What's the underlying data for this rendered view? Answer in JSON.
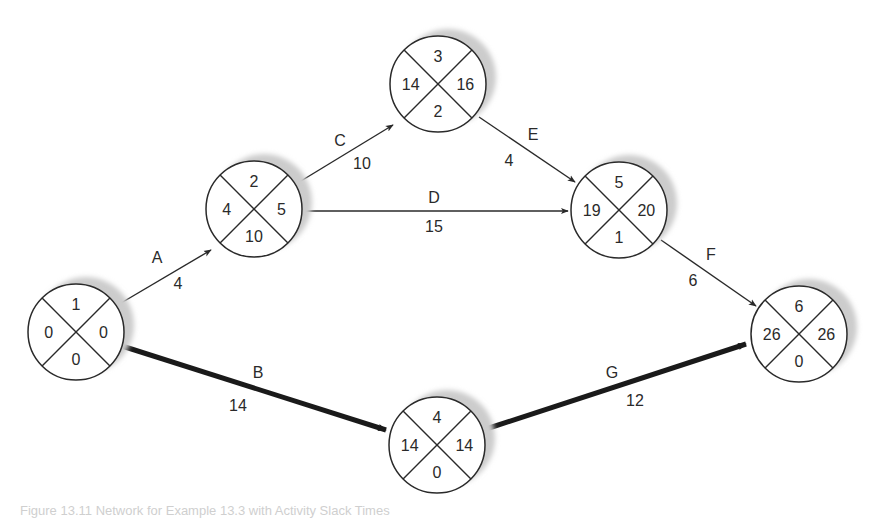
{
  "diagram": {
    "type": "activity-on-arrow network (critical path)",
    "node_radius": 48,
    "node_quadrants": [
      "top",
      "left",
      "right",
      "bottom"
    ],
    "colors": {
      "line": "#2a2a2a",
      "shadow": "#cccccc",
      "critical": "#1a1a1a"
    },
    "nodes": [
      {
        "id": "1",
        "cx": 76,
        "cy": 332,
        "top": "1",
        "left": "0",
        "right": "0",
        "bottom": "0"
      },
      {
        "id": "2",
        "cx": 254,
        "cy": 209,
        "top": "2",
        "left": "4",
        "right": "5",
        "bottom": "10"
      },
      {
        "id": "3",
        "cx": 438,
        "cy": 84,
        "top": "3",
        "left": "14",
        "right": "16",
        "bottom": "2"
      },
      {
        "id": "5",
        "cx": 619,
        "cy": 210,
        "top": "5",
        "left": "19",
        "right": "20",
        "bottom": "1"
      },
      {
        "id": "6",
        "cx": 799,
        "cy": 334,
        "top": "6",
        "left": "26",
        "right": "26",
        "bottom": "0"
      },
      {
        "id": "4",
        "cx": 437,
        "cy": 445,
        "top": "4",
        "left": "14",
        "right": "14",
        "bottom": "0"
      }
    ],
    "edges": [
      {
        "activity": "A",
        "duration": "4",
        "from": "1",
        "to": "2",
        "critical": false,
        "x1": 116,
        "y1": 306,
        "x2": 211,
        "y2": 250,
        "label_x": 157,
        "label_y": 257,
        "dur_x": 178,
        "dur_y": 283
      },
      {
        "activity": "B",
        "duration": "14",
        "from": "1",
        "to": "4",
        "critical": true,
        "x1": 122,
        "y1": 346,
        "x2": 386,
        "y2": 430,
        "label_x": 258,
        "label_y": 372,
        "dur_x": 238,
        "dur_y": 405
      },
      {
        "activity": "C",
        "duration": "10",
        "from": "2",
        "to": "3",
        "critical": false,
        "x1": 296,
        "y1": 184,
        "x2": 393,
        "y2": 125,
        "label_x": 340,
        "label_y": 140,
        "dur_x": 362,
        "dur_y": 163
      },
      {
        "activity": "D",
        "duration": "15",
        "from": "2",
        "to": "5",
        "critical": false,
        "x1": 302,
        "y1": 211,
        "x2": 568,
        "y2": 211,
        "label_x": 434,
        "label_y": 197,
        "dur_x": 434,
        "dur_y": 226
      },
      {
        "activity": "E",
        "duration": "4",
        "from": "3",
        "to": "5",
        "critical": false,
        "x1": 479,
        "y1": 117,
        "x2": 575,
        "y2": 182,
        "label_x": 533,
        "label_y": 134,
        "dur_x": 509,
        "dur_y": 160
      },
      {
        "activity": "F",
        "duration": "6",
        "from": "5",
        "to": "6",
        "critical": false,
        "x1": 661,
        "y1": 240,
        "x2": 756,
        "y2": 306,
        "label_x": 711,
        "label_y": 254,
        "dur_x": 693,
        "dur_y": 280
      },
      {
        "activity": "G",
        "duration": "12",
        "from": "4",
        "to": "6",
        "critical": true,
        "x1": 483,
        "y1": 430,
        "x2": 746,
        "y2": 344,
        "label_x": 612,
        "label_y": 372,
        "dur_x": 635,
        "dur_y": 400
      }
    ]
  },
  "caption": "Figure 13.11  Network for Example 13.3 with Activity Slack Times"
}
